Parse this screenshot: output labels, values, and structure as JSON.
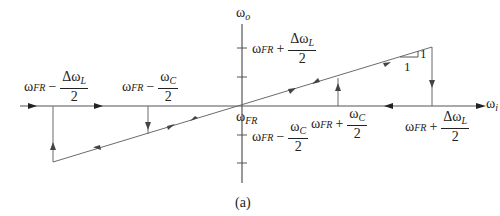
{
  "figure": {
    "caption": "(a)",
    "axes": {
      "x_label": {
        "symbol": "ω",
        "sub": "i"
      },
      "y_label": {
        "symbol": "ω",
        "sub": "o"
      },
      "origin_label": {
        "symbol": "ω",
        "sub": "FR"
      }
    },
    "x_annotations": [
      {
        "id": "neg-lock",
        "base": "ω",
        "sub": "FR",
        "op": "−",
        "num": "Δω",
        "num_sub": "L",
        "den": "2"
      },
      {
        "id": "neg-capture",
        "base": "ω",
        "sub": "FR",
        "op": "−",
        "num": "ω",
        "num_sub": "C",
        "den": "2"
      },
      {
        "id": "pos-capture",
        "base": "ω",
        "sub": "FR",
        "op": "+",
        "num": "ω",
        "num_sub": "C",
        "den": "2"
      },
      {
        "id": "pos-lock",
        "base": "ω",
        "sub": "FR",
        "op": "+",
        "num": "Δω",
        "num_sub": "L",
        "den": "2"
      }
    ],
    "y_annotations": [
      {
        "id": "y-pos-lock",
        "base": "ω",
        "sub": "FR",
        "op": "+",
        "num": "Δω",
        "num_sub": "L",
        "den": "2"
      },
      {
        "id": "y-neg-capture",
        "base": "ω",
        "sub": "FR",
        "op": "−",
        "num": "ω",
        "num_sub": "C",
        "den": "2"
      }
    ],
    "slope_triangle": {
      "run": "1",
      "rise": "1"
    },
    "colors": {
      "line": "#6b6b6b",
      "axis": "#555555",
      "text": "#222222",
      "background": "#ffffff"
    }
  }
}
